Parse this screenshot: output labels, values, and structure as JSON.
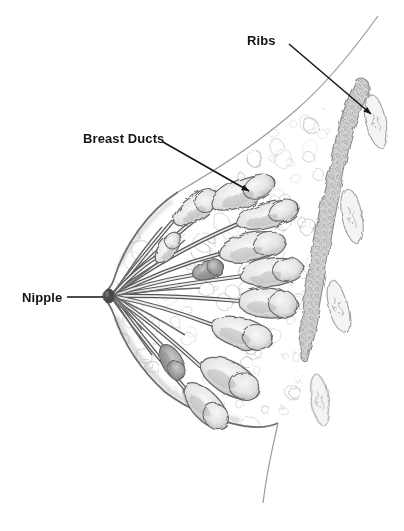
{
  "figure": {
    "type": "anatomical line drawing"
  },
  "labels": {
    "ribs": "Ribs",
    "breast_ducts": "Breast Ducts",
    "nipple": "Nipple"
  },
  "palette": {
    "ink": "#141414",
    "pencil_dark": "#565656",
    "pencil_mid": "#8d8d8d",
    "pencil_light": "#cdcdcd",
    "paper": "#ffffff"
  }
}
